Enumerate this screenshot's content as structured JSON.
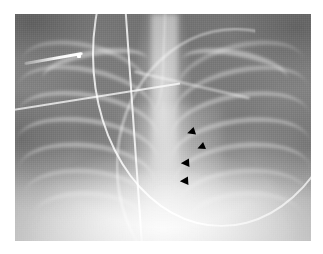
{
  "image": {
    "type": "radiograph",
    "modality": "X-ray",
    "view": "AP chest",
    "subject": "neonate",
    "alt_text": "Frontal chest radiograph of an infant showing ribs, central spine, an indwelling catheter and an arcing tube, with four black arrowheads marking a paramediastinal finding on the left side of the chest.",
    "frame": {
      "background_color": "#ffffff",
      "plate_left": 15,
      "plate_top": 14,
      "plate_width": 296,
      "plate_height": 227,
      "plate_base_color": "#8e8e8e"
    }
  },
  "annotations": {
    "marker_color": "#000000",
    "marker_shape": "arrowhead-left",
    "count": 4,
    "arrowheads": [
      {
        "label": "arrowhead-1",
        "x": 187,
        "y": 128,
        "rotation": -18,
        "scale": 1.0
      },
      {
        "label": "arrowhead-2",
        "x": 197,
        "y": 143,
        "rotation": -22,
        "scale": 0.95
      },
      {
        "label": "arrowhead-3",
        "x": 181,
        "y": 159,
        "rotation": -4,
        "scale": 1.05
      },
      {
        "label": "arrowhead-4",
        "x": 180,
        "y": 177,
        "rotation": -4,
        "scale": 1.05
      }
    ]
  },
  "anatomy": {
    "ribs_right": [
      {
        "label": "rib-right-1",
        "left": 1,
        "top": 20,
        "width": 44,
        "height": 26,
        "rotate": 14,
        "opacity": 0.3
      },
      {
        "label": "rib-right-2",
        "left": 0,
        "top": 30,
        "width": 47,
        "height": 26,
        "rotate": 12,
        "opacity": 0.34
      },
      {
        "label": "rib-right-3",
        "left": 0,
        "top": 40,
        "width": 48,
        "height": 26,
        "rotate": 10,
        "opacity": 0.36
      },
      {
        "label": "rib-right-4",
        "left": 0,
        "top": 50,
        "width": 48,
        "height": 26,
        "rotate": 8,
        "opacity": 0.36
      },
      {
        "label": "rib-right-5",
        "left": 1,
        "top": 60,
        "width": 46,
        "height": 26,
        "rotate": 6,
        "opacity": 0.34
      },
      {
        "label": "rib-right-6",
        "left": 3,
        "top": 70,
        "width": 42,
        "height": 24,
        "rotate": 4,
        "opacity": 0.28
      },
      {
        "label": "rib-right-7",
        "left": 6,
        "top": 79,
        "width": 37,
        "height": 22,
        "rotate": 2,
        "opacity": 0.22
      }
    ],
    "ribs_left": [
      {
        "label": "rib-left-1",
        "left": 55,
        "top": 20,
        "width": 44,
        "height": 26,
        "rotate": -14,
        "opacity": 0.28
      },
      {
        "label": "rib-left-2",
        "left": 54,
        "top": 30,
        "width": 46,
        "height": 26,
        "rotate": -12,
        "opacity": 0.32
      },
      {
        "label": "rib-left-3",
        "left": 53,
        "top": 40,
        "width": 47,
        "height": 26,
        "rotate": -10,
        "opacity": 0.34
      },
      {
        "label": "rib-left-4",
        "left": 53,
        "top": 50,
        "width": 47,
        "height": 26,
        "rotate": -8,
        "opacity": 0.34
      },
      {
        "label": "rib-left-5",
        "left": 54,
        "top": 60,
        "width": 46,
        "height": 26,
        "rotate": -6,
        "opacity": 0.32
      },
      {
        "label": "rib-left-6",
        "left": 56,
        "top": 70,
        "width": 43,
        "height": 24,
        "rotate": -4,
        "opacity": 0.26
      },
      {
        "label": "rib-left-7",
        "left": 59,
        "top": 79,
        "width": 38,
        "height": 22,
        "rotate": -2,
        "opacity": 0.2
      }
    ],
    "clavicles": [
      {
        "label": "clavicle-right",
        "left": 9,
        "top": 16,
        "width": 36,
        "height": 14,
        "rotate": -10,
        "opacity": 0.4
      },
      {
        "label": "clavicle-left",
        "left": 56,
        "top": 16,
        "width": 36,
        "height": 14,
        "rotate": 10,
        "opacity": 0.4
      }
    ]
  },
  "devices": [
    {
      "label": "vertical-catheter",
      "description": "radiopaque line descending near midline"
    },
    {
      "label": "arcing-tube",
      "description": "curved radiopaque tube arcing across the upper right hemithorax"
    },
    {
      "label": "lead-wire",
      "description": "thin monitoring lead crossing from upper left toward midline"
    },
    {
      "label": "metal-clip",
      "description": "bright linear metallic density in the upper left corner"
    }
  ]
}
